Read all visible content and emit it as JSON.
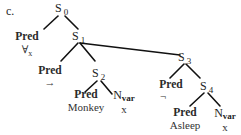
{
  "figure_label": "c.",
  "nodes": {
    "s0": {
      "base": "S",
      "sub": "0"
    },
    "s1": {
      "base": "S",
      "sub": "1"
    },
    "s2": {
      "base": "S",
      "sub": "2"
    },
    "s3": {
      "base": "S",
      "sub": "3"
    },
    "s4": {
      "base": "S",
      "sub": "4"
    },
    "pred_forall": {
      "head": "Pred",
      "value": "∀",
      "value_sub": "x"
    },
    "pred_arrow": {
      "head": "Pred",
      "value": "→"
    },
    "pred_monkey": {
      "head": "Pred",
      "value": "Monkey"
    },
    "nvar_1": {
      "base": "N",
      "sub": "var",
      "value": "x"
    },
    "pred_neg": {
      "head": "Pred",
      "value": "¬"
    },
    "pred_asleep": {
      "head": "Pred",
      "value": "Asleep"
    },
    "nvar_2": {
      "base": "N",
      "sub": "var",
      "value": "x"
    }
  },
  "edges": [
    [
      "s0",
      "pred_forall"
    ],
    [
      "s0",
      "s1"
    ],
    [
      "s1",
      "pred_arrow"
    ],
    [
      "s1",
      "s2"
    ],
    [
      "s1",
      "s3"
    ],
    [
      "s2",
      "pred_monkey"
    ],
    [
      "s2",
      "nvar_1"
    ],
    [
      "s3",
      "pred_neg"
    ],
    [
      "s3",
      "s4"
    ],
    [
      "s4",
      "pred_asleep"
    ],
    [
      "s4",
      "nvar_2"
    ]
  ]
}
